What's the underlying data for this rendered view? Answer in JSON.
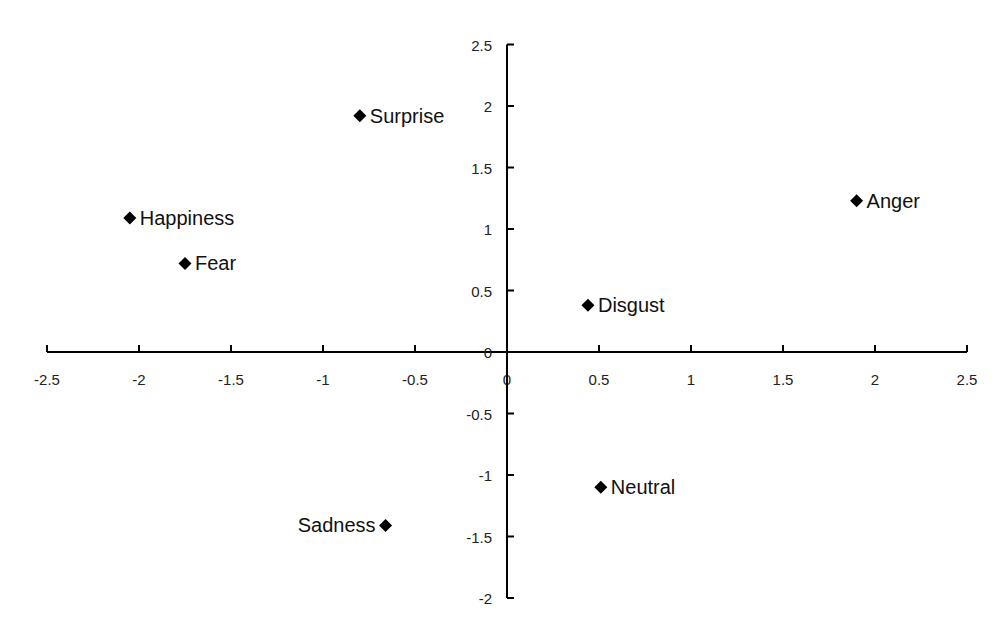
{
  "chart_data": {
    "type": "scatter",
    "title": "",
    "xlabel": "",
    "ylabel": "",
    "xlim": [
      -2.5,
      2.5
    ],
    "ylim": [
      -2,
      2.5
    ],
    "grid": false,
    "legend": null,
    "marker": "diamond",
    "x_ticks": [
      -2.5,
      -2,
      -1.5,
      -1,
      -0.5,
      0,
      0.5,
      1,
      1.5,
      2,
      2.5
    ],
    "x_tick_labels": [
      "-2.5",
      "-2",
      "-1.5",
      "-1",
      "-0.5",
      "0",
      "0.5",
      "1",
      "1.5",
      "2",
      "2.5"
    ],
    "y_ticks": [
      -2,
      -1.5,
      -1,
      -0.5,
      0,
      0.5,
      1,
      1.5,
      2,
      2.5
    ],
    "y_tick_labels": [
      "-2",
      "-1.5",
      "-1",
      "-0.5",
      "0",
      "0.5",
      "1",
      "1.5",
      "2",
      "2.5"
    ],
    "points": [
      {
        "label": "Surprise",
        "x": -0.8,
        "y": 1.92,
        "label_side": "right"
      },
      {
        "label": "Happiness",
        "x": -2.05,
        "y": 1.09,
        "label_side": "right"
      },
      {
        "label": "Fear",
        "x": -1.75,
        "y": 0.72,
        "label_side": "right"
      },
      {
        "label": "Anger",
        "x": 1.9,
        "y": 1.23,
        "label_side": "right"
      },
      {
        "label": "Disgust",
        "x": 0.44,
        "y": 0.38,
        "label_side": "right"
      },
      {
        "label": "Neutral",
        "x": 0.51,
        "y": -1.1,
        "label_side": "right"
      },
      {
        "label": "Sadness",
        "x": -0.66,
        "y": -1.41,
        "label_side": "left"
      }
    ]
  },
  "colors": {
    "background": "#ffffff",
    "axis": "#000000",
    "marker": "#000000",
    "text": "#111111"
  }
}
